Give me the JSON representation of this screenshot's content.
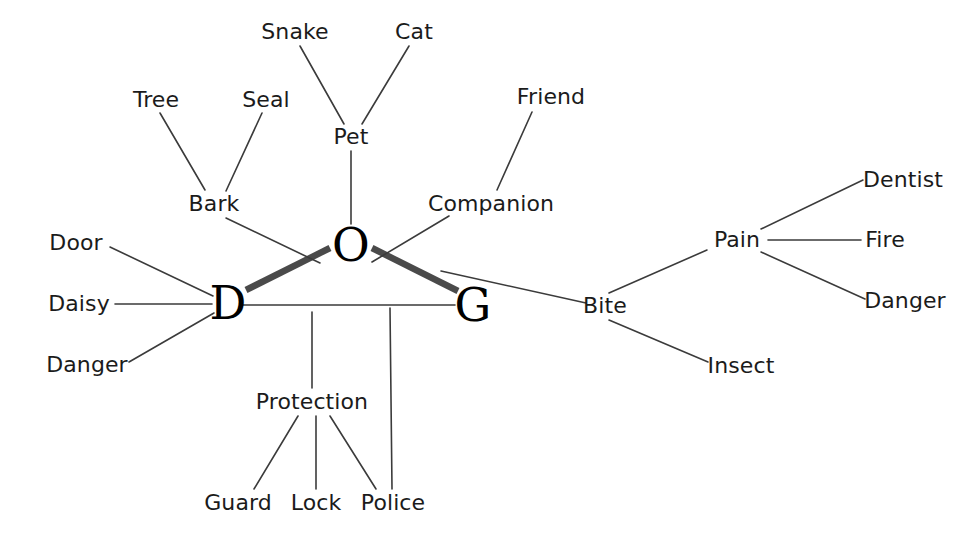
{
  "diagram": {
    "type": "node-link-graph",
    "canvas": {
      "width": 977,
      "height": 540
    },
    "colors": {
      "background": "#ffffff",
      "label_text": "#1b1b1b",
      "core_text": "#000000",
      "edge_thin": "#3b3b3b",
      "edge_thick": "#4a4a4a"
    },
    "core_nodes": [
      {
        "id": "D",
        "label": "D",
        "x": 228,
        "y": 303
      },
      {
        "id": "O",
        "label": "O",
        "x": 351,
        "y": 245
      },
      {
        "id": "G",
        "label": "G",
        "x": 473,
        "y": 305
      }
    ],
    "nodes": [
      {
        "id": "tree",
        "label": "Tree",
        "x": 156,
        "y": 100
      },
      {
        "id": "seal",
        "label": "Seal",
        "x": 266,
        "y": 100
      },
      {
        "id": "snake",
        "label": "Snake",
        "x": 295,
        "y": 32
      },
      {
        "id": "cat",
        "label": "Cat",
        "x": 414,
        "y": 32
      },
      {
        "id": "friend",
        "label": "Friend",
        "x": 551,
        "y": 97
      },
      {
        "id": "bark",
        "label": "Bark",
        "x": 214,
        "y": 204
      },
      {
        "id": "pet",
        "label": "Pet",
        "x": 351,
        "y": 137
      },
      {
        "id": "companion",
        "label": "Companion",
        "x": 491,
        "y": 204
      },
      {
        "id": "door",
        "label": "Door",
        "x": 76,
        "y": 243
      },
      {
        "id": "daisy",
        "label": "Daisy",
        "x": 79,
        "y": 304
      },
      {
        "id": "danger_l",
        "label": "Danger",
        "x": 87,
        "y": 365
      },
      {
        "id": "protection",
        "label": "Protection",
        "x": 312,
        "y": 402
      },
      {
        "id": "guard",
        "label": "Guard",
        "x": 238,
        "y": 503
      },
      {
        "id": "lock",
        "label": "Lock",
        "x": 316,
        "y": 503
      },
      {
        "id": "police",
        "label": "Police",
        "x": 393,
        "y": 503
      },
      {
        "id": "bite",
        "label": "Bite",
        "x": 605,
        "y": 306
      },
      {
        "id": "insect",
        "label": "Insect",
        "x": 741,
        "y": 366
      },
      {
        "id": "pain",
        "label": "Pain",
        "x": 737,
        "y": 240
      },
      {
        "id": "dentist",
        "label": "Dentist",
        "x": 903,
        "y": 180
      },
      {
        "id": "fire",
        "label": "Fire",
        "x": 885,
        "y": 240
      },
      {
        "id": "danger_r",
        "label": "Danger",
        "x": 905,
        "y": 301
      }
    ],
    "edges": [
      {
        "from": "D",
        "to": "O",
        "weight": "strong",
        "x1": 246,
        "y1": 290,
        "x2": 330,
        "y2": 248
      },
      {
        "from": "O",
        "to": "G",
        "weight": "strong",
        "x1": 372,
        "y1": 248,
        "x2": 458,
        "y2": 291
      },
      {
        "from": "D",
        "to": "G",
        "weight": "weak",
        "x1": 243,
        "y1": 305,
        "x2": 455,
        "y2": 305
      },
      {
        "from": "tree",
        "to": "bark",
        "weight": "weak",
        "x1": 160,
        "y1": 113,
        "x2": 205,
        "y2": 190
      },
      {
        "from": "seal",
        "to": "bark",
        "weight": "weak",
        "x1": 262,
        "y1": 113,
        "x2": 226,
        "y2": 191
      },
      {
        "from": "snake",
        "to": "pet",
        "weight": "weak",
        "x1": 300,
        "y1": 46,
        "x2": 344,
        "y2": 124
      },
      {
        "from": "cat",
        "to": "pet",
        "weight": "weak",
        "x1": 409,
        "y1": 46,
        "x2": 362,
        "y2": 124
      },
      {
        "from": "bark",
        "to": "D",
        "weight": "weak",
        "x1": 226,
        "y1": 218,
        "x2": 320,
        "y2": 263
      },
      {
        "from": "pet",
        "to": "O",
        "weight": "weak",
        "x1": 351,
        "y1": 151,
        "x2": 351,
        "y2": 224
      },
      {
        "from": "friend",
        "to": "companion",
        "weight": "weak",
        "x1": 532,
        "y1": 112,
        "x2": 497,
        "y2": 190
      },
      {
        "from": "companion",
        "to": "O",
        "weight": "weak",
        "x1": 449,
        "y1": 216,
        "x2": 372,
        "y2": 262
      },
      {
        "from": "door",
        "to": "D",
        "weight": "weak",
        "x1": 110,
        "y1": 247,
        "x2": 213,
        "y2": 296
      },
      {
        "from": "daisy",
        "to": "D",
        "weight": "weak",
        "x1": 115,
        "y1": 304,
        "x2": 212,
        "y2": 304
      },
      {
        "from": "danger_l",
        "to": "D",
        "weight": "weak",
        "x1": 129,
        "y1": 362,
        "x2": 214,
        "y2": 313
      },
      {
        "from": "D",
        "to": "protection",
        "weight": "weak",
        "x1": 312,
        "y1": 312,
        "x2": 312,
        "y2": 388
      },
      {
        "from": "protection",
        "to": "guard",
        "weight": "weak",
        "x1": 298,
        "y1": 416,
        "x2": 254,
        "y2": 489
      },
      {
        "from": "protection",
        "to": "lock",
        "weight": "weak",
        "x1": 316,
        "y1": 416,
        "x2": 316,
        "y2": 489
      },
      {
        "from": "protection",
        "to": "police",
        "weight": "weak",
        "x1": 330,
        "y1": 416,
        "x2": 376,
        "y2": 489
      },
      {
        "from": "D",
        "to": "police",
        "weight": "weak",
        "x1": 390,
        "y1": 308,
        "x2": 392,
        "y2": 489
      },
      {
        "from": "G",
        "to": "bite",
        "weight": "weak",
        "x1": 441,
        "y1": 271,
        "x2": 586,
        "y2": 303
      },
      {
        "from": "bite",
        "to": "pain",
        "weight": "weak",
        "x1": 609,
        "y1": 293,
        "x2": 707,
        "y2": 250
      },
      {
        "from": "bite",
        "to": "insect",
        "weight": "weak",
        "x1": 609,
        "y1": 320,
        "x2": 708,
        "y2": 362
      },
      {
        "from": "pain",
        "to": "dentist",
        "weight": "weak",
        "x1": 761,
        "y1": 229,
        "x2": 863,
        "y2": 180
      },
      {
        "from": "pain",
        "to": "fire",
        "weight": "weak",
        "x1": 768,
        "y1": 240,
        "x2": 861,
        "y2": 240
      },
      {
        "from": "pain",
        "to": "danger_r",
        "weight": "weak",
        "x1": 761,
        "y1": 252,
        "x2": 865,
        "y2": 299
      }
    ]
  }
}
